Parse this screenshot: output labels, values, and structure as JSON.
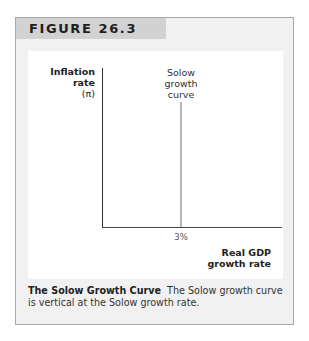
{
  "figure": {
    "label": "FIGURE 26.3",
    "caption_title": "The Solow Growth Curve",
    "caption_text": "The Solow growth curve is vertical at the Solow growth rate."
  },
  "chart_data": {
    "type": "line",
    "title": "The Solow Growth Curve",
    "xlabel": "Real GDP growth rate",
    "ylabel": "Inflation rate (π)",
    "ylabel_lines": [
      "Inflation",
      "rate",
      "(π)"
    ],
    "xlabel_lines": [
      "Real GDP",
      "growth rate"
    ],
    "x_ticks": [
      "3%"
    ],
    "series": [
      {
        "name": "Solow growth curve",
        "label_lines": [
          "Solow",
          "growth",
          "curve"
        ],
        "x": [
          3,
          3
        ],
        "y": [
          "low",
          "high"
        ],
        "orientation": "vertical",
        "color": "#b5b5b5"
      }
    ],
    "grid": false,
    "legend": "none"
  },
  "colors": {
    "header_band": "#d2d2d2",
    "frame_bg": "#f1f1f1",
    "panel_bg": "#ffffff",
    "curve": "#b5b5b5"
  }
}
